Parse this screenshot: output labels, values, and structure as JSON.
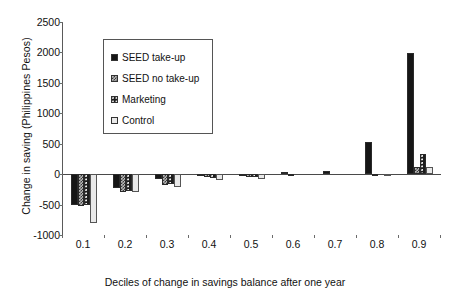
{
  "chart_data": {
    "type": "bar",
    "title": "",
    "xlabel": "Deciles of change in savings balance after one year",
    "ylabel": "Change in saving (Philippines Pesos)",
    "categories": [
      "0.1",
      "0.2",
      "0.3",
      "0.4",
      "0.5",
      "0.6",
      "0.7",
      "0.8",
      "0.9"
    ],
    "ylim": [
      -1000,
      2500
    ],
    "ytick_labels": [
      "2500",
      "2000",
      "1500",
      "1000",
      "500",
      "0",
      "-500",
      "-1000"
    ],
    "ytick_values": [
      2500,
      2000,
      1500,
      1000,
      500,
      0,
      -500,
      -1000
    ],
    "grid": false,
    "legend_position": "upper-left-inset",
    "series": [
      {
        "name": "SEED take-up",
        "pattern": "dark-dotted",
        "color": "#161616",
        "values": [
          -510,
          -220,
          -75,
          -20,
          -10,
          35,
          45,
          530,
          1990
        ]
      },
      {
        "name": "SEED no take-up",
        "pattern": "checker-grey",
        "color": "#b9b9b9",
        "values": [
          -520,
          -290,
          -185,
          -55,
          -55,
          -20,
          0,
          -15,
          120
        ]
      },
      {
        "name": "Marketing",
        "pattern": "dark-dotted-dense",
        "color": "#1d1d1d",
        "values": [
          -510,
          -285,
          -165,
          -60,
          -45,
          0,
          0,
          0,
          330
        ]
      },
      {
        "name": "Control",
        "pattern": "light-dotted",
        "color": "#e9e9e9",
        "values": [
          -805,
          -300,
          -215,
          -90,
          -75,
          0,
          0,
          10,
          120
        ]
      }
    ]
  },
  "legend": {
    "items": [
      {
        "label": "SEED take-up"
      },
      {
        "label": "SEED no take-up"
      },
      {
        "label": "Marketing"
      },
      {
        "label": "Control"
      }
    ]
  }
}
